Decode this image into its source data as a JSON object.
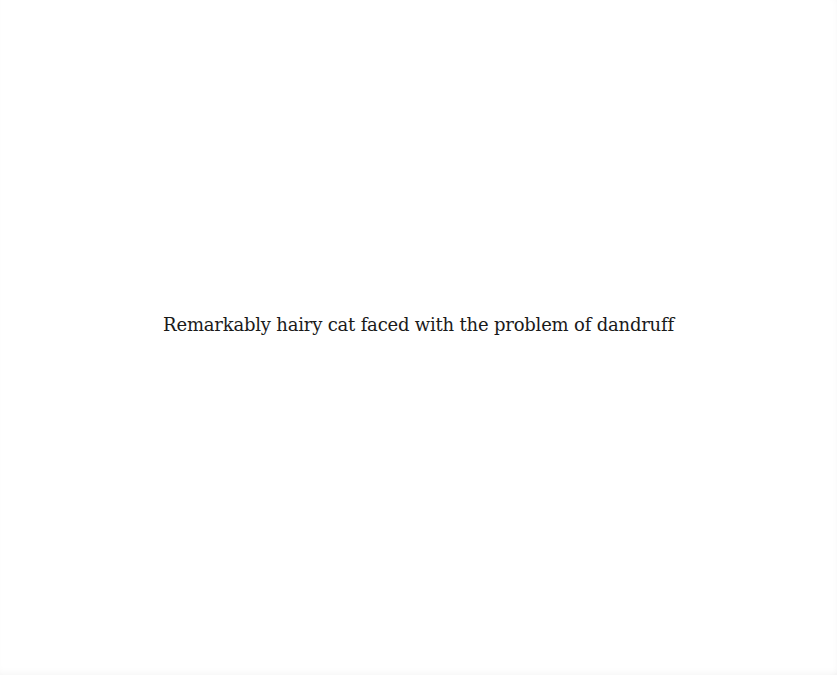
{
  "page": {
    "background": "#ffffff",
    "caption": "Remarkably hairy cat faced with the problem of dandruff",
    "text_color": "#1a1a1a"
  }
}
